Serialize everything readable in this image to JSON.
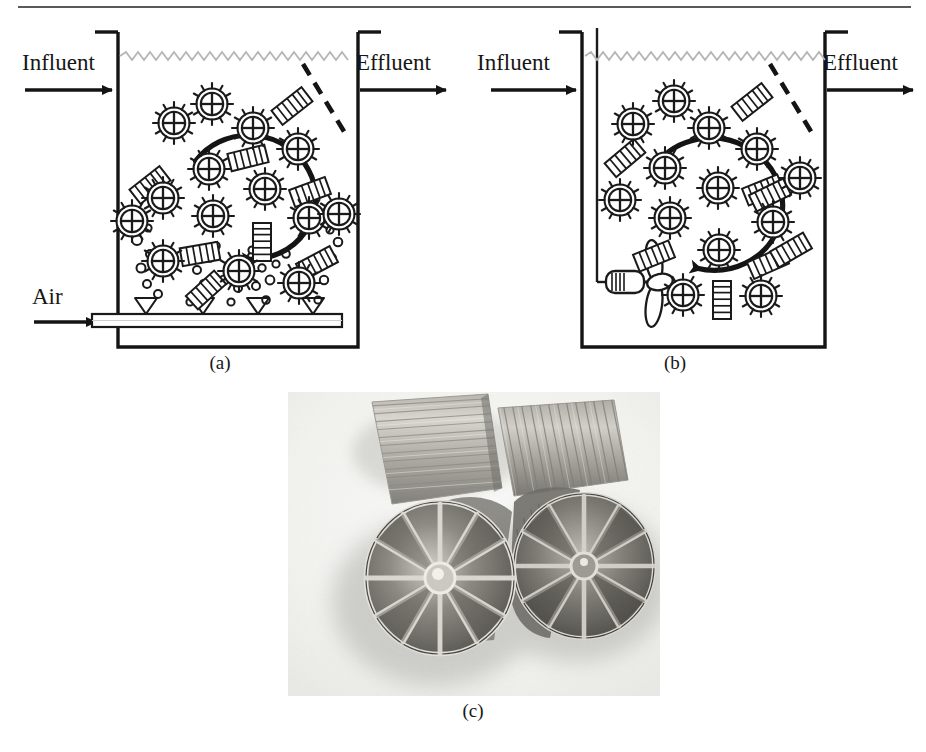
{
  "figure": {
    "title": "Moving bed biofilm reactor (MBBR) schematic and carrier photograph",
    "panels": [
      {
        "id": "a",
        "caption": "(a)",
        "description": "Aerated moving bed biofilm reactor with air diffuser",
        "labels": {
          "influent": "Influent",
          "effluent": "Effluent",
          "air": "Air"
        },
        "features": [
          "influent-arrow",
          "effluent-arrow",
          "air-inlet-arrow",
          "water-surface-line",
          "retention-sieve-dashed",
          "circulation-arrow",
          "air-diffuser-pipe",
          "diffuser-nozzles",
          "air-bubbles",
          "wheel-carriers",
          "sponge-carriers"
        ],
        "counts": {
          "diffuser_nozzles": 4,
          "wheel_carriers": 14,
          "sponge_carriers": 8
        }
      },
      {
        "id": "b",
        "caption": "(b)",
        "description": "Mechanically mixed moving bed biofilm reactor with submersible propeller mixer",
        "labels": {
          "influent": "Influent",
          "effluent": "Effluent"
        },
        "features": [
          "influent-arrow",
          "effluent-arrow",
          "water-surface-line",
          "retention-sieve-dashed",
          "circulation-arrow",
          "submersible-mixer",
          "mixer-propeller",
          "mixer-conduit",
          "wheel-carriers",
          "sponge-carriers"
        ],
        "counts": {
          "wheel_carriers": 13,
          "sponge_carriers": 8,
          "propeller_blades": 3
        }
      },
      {
        "id": "c",
        "caption": "(c)",
        "description": "Close-up grayscale photograph of four cylindrical biofilm carriers; two shown end-on revealing radial internal partitions, two shown from the side revealing longitudinal ribbing",
        "features": [
          "carrier-end-on-left",
          "carrier-end-on-right",
          "carrier-side-upper-left",
          "carrier-side-upper-right",
          "drop-shadow",
          "white-background"
        ],
        "counts": {
          "carriers_visible": 4,
          "radial_partitions": 12
        }
      }
    ]
  },
  "colors": {
    "ink": "#1a1a1a",
    "tank_wall": "#141414",
    "water_surface": "#b0b0b0",
    "carrier_fill": "#ffffff",
    "photo_background": "#f4f4f2",
    "photo_midtone": "#8e8e8a",
    "photo_dark": "#4a4a47",
    "rule": "#5a5a5a"
  }
}
